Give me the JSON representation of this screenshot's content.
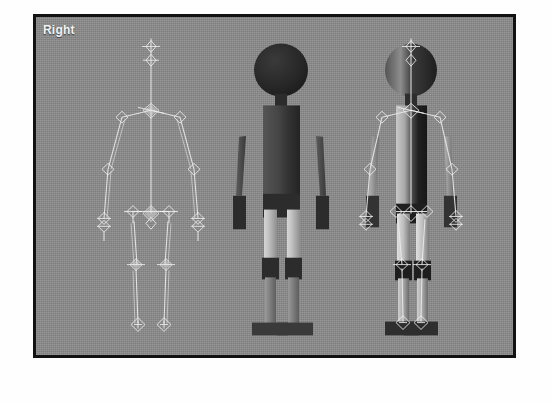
{
  "app": {
    "view_label": "Right",
    "background_color": "#fefefe",
    "viewport_background_color": "#8b8b8b",
    "viewport_border_color": "#121212",
    "label_color": "#f2f2f2"
  },
  "viewport": {
    "label": "Right",
    "figures": [
      {
        "id": "skeleton",
        "name": "skeleton-rig-figure",
        "display_mode": "Bones only",
        "color": "#e8e8e8"
      },
      {
        "id": "mesh",
        "name": "mannequin-mesh-figure",
        "display_mode": "Shaded mesh",
        "color": "#2c2c2c"
      },
      {
        "id": "combined",
        "name": "rig-and-mesh-figure",
        "display_mode": "Mesh with bones",
        "color": "#b9b9b9"
      }
    ]
  },
  "parts": {
    "head": "head",
    "neck": "neck",
    "torso": "torso",
    "upper_arm": "upper-arm",
    "forearm": "forearm",
    "hand": "hand",
    "pelvis": "pelvis",
    "thigh": "thigh",
    "shin": "shin",
    "foot": "foot"
  }
}
